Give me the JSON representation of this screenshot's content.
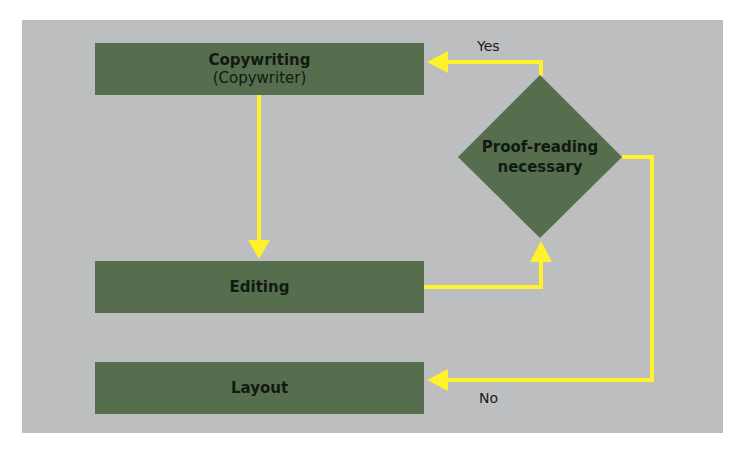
{
  "diagram": {
    "colors": {
      "background": "#bcbec0",
      "node_fill": "#566e4e",
      "node_text": "#111a10",
      "arrow": "#fff22a"
    },
    "nodes": [
      {
        "id": "copywriting",
        "label": "Copywriting",
        "sublabel": "(Copywriter)",
        "shape": "rect"
      },
      {
        "id": "editing",
        "label": "Editing",
        "shape": "rect"
      },
      {
        "id": "proofreading",
        "label_line1": "Proof-reading",
        "label_line2": "necessary",
        "shape": "diamond"
      },
      {
        "id": "layout",
        "label": "Layout",
        "shape": "rect"
      }
    ],
    "edges": [
      {
        "from": "copywriting",
        "to": "editing",
        "label": ""
      },
      {
        "from": "editing",
        "to": "proofreading",
        "label": ""
      },
      {
        "from": "proofreading",
        "to": "copywriting",
        "label": "Yes"
      },
      {
        "from": "proofreading",
        "to": "layout",
        "label": "No"
      }
    ],
    "edge_labels": {
      "yes": "Yes",
      "no": "No"
    }
  }
}
